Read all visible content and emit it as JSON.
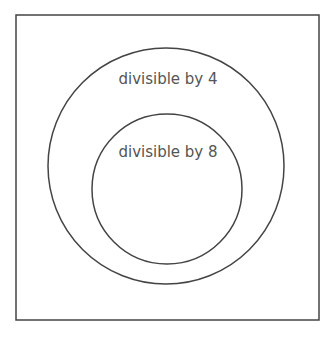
{
  "diagram": {
    "type": "venn-nested",
    "frame": {
      "x": 16,
      "y": 15,
      "width": 303,
      "height": 305
    },
    "stroke_color": "#444444",
    "text_color": "#555555",
    "sets": [
      {
        "id": "outer",
        "label": "divisible by 4",
        "cx": 166,
        "cy": 166,
        "r": 118
      },
      {
        "id": "inner",
        "label": "divisible by 8",
        "cx": 167,
        "cy": 189,
        "r": 75
      }
    ]
  }
}
